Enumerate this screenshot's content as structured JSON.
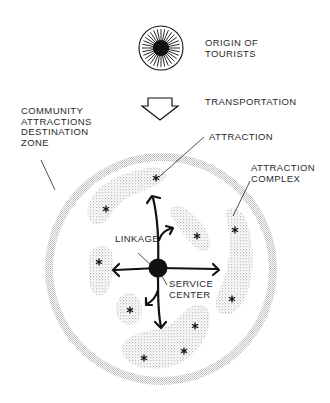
{
  "diagram": {
    "type": "tourism destination zone model",
    "labels": {
      "origin": "ORIGIN OF\nTOURISTS",
      "transportation": "TRANSPORTATION",
      "zone": "COMMUNITY\nATTRACTIONS\nDESTINATION\nZONE",
      "attraction": "ATTRACTION",
      "attraction_complex": "ATTRACTION\nCOMPLEX",
      "linkage": "LINKAGE",
      "service_center": "SERVICE\nCENTER"
    },
    "nodes": [
      {
        "id": "origin",
        "shape": "sunburst-circle"
      },
      {
        "id": "transportation",
        "shape": "hollow-down-arrow"
      },
      {
        "id": "destination-zone",
        "shape": "stippled-ring"
      },
      {
        "id": "service-center",
        "shape": "filled-circle"
      },
      {
        "id": "attraction-clusters",
        "count": 7,
        "shape": "stippled-blob-with-asterisks"
      }
    ],
    "flow": [
      "origin",
      "transportation",
      "destination-zone"
    ],
    "linkages": "arrows radiate from service center to attraction clusters",
    "colors": {
      "ink": "#1a1a1a",
      "stipple": "#9a9a9a",
      "ring": "#c8c8c8"
    }
  }
}
